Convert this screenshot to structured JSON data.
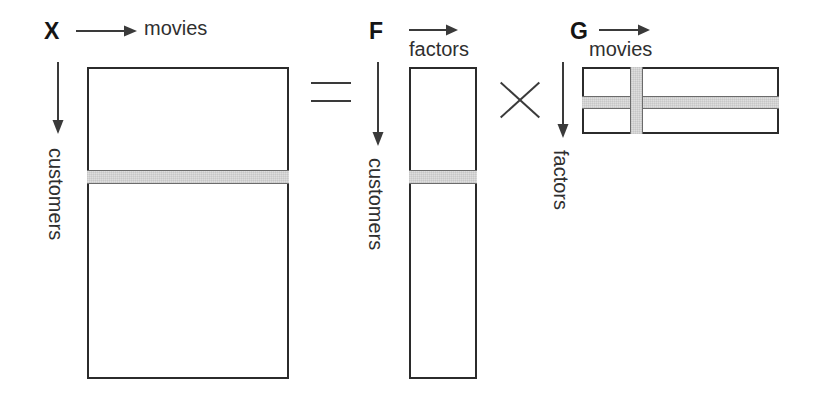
{
  "diagram": {
    "stroke_color": "#2b2b2b",
    "shade_color": "#dedede",
    "shade_edge_color": "#6b6b6b"
  },
  "matrices": {
    "x": {
      "name": "X",
      "column_axis_label": "movies",
      "row_axis_label": "customers",
      "column_arrow": "right-arrow-icon",
      "row_arrow": "down-arrow-icon",
      "highlighted_row_band": "customer-row-stripe"
    },
    "f": {
      "name": "F",
      "column_axis_label": "factors",
      "row_axis_label": "customers",
      "column_arrow": "right-arrow-icon",
      "row_arrow": "down-arrow-icon",
      "highlighted_row_band": "customer-row-stripe"
    },
    "g": {
      "name": "G",
      "column_axis_label": "movies",
      "row_axis_label": "factors",
      "column_arrow": "right-arrow-icon",
      "row_arrow": "down-arrow-icon",
      "highlighted_row_band": "factor-row-stripe",
      "highlighted_column_band": "movie-column-stripe"
    }
  },
  "operators": {
    "equals": "=",
    "times": "×"
  }
}
